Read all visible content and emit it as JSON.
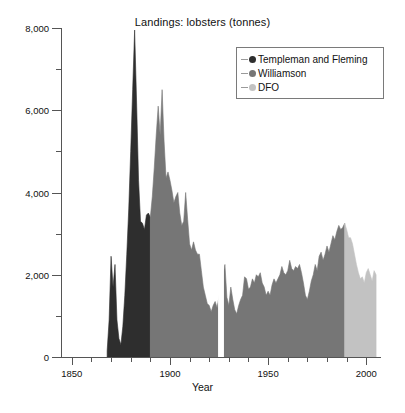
{
  "chart_data": {
    "type": "area",
    "title": "Landings: lobsters (tonnes)",
    "xlabel": "Year",
    "ylabel": "",
    "xlim": [
      1845,
      2007
    ],
    "ylim": [
      0,
      8000
    ],
    "grid": false,
    "legend_position": "top-right",
    "x_major_ticks": [
      1850,
      1900,
      1950,
      2000
    ],
    "x_major_tick_labels": [
      "1850",
      "1900",
      "1950",
      "2000"
    ],
    "x_minor_tick_step": 10,
    "y_major_ticks": [
      0,
      2000,
      4000,
      6000,
      8000
    ],
    "y_major_tick_labels": [
      "0",
      "2,000",
      "4,000",
      "6,000",
      "8,000"
    ],
    "y_minor_ticks": [
      1000,
      3000,
      5000,
      7000
    ],
    "series": [
      {
        "name": "Templeman and Fleming",
        "color": "#2e2e2e",
        "x": [
          1868,
          1869,
          1870,
          1871,
          1872,
          1873,
          1874,
          1875,
          1876,
          1877,
          1878,
          1879,
          1880,
          1881,
          1882,
          1883,
          1884,
          1885,
          1886,
          1887,
          1888,
          1889,
          1890
        ],
        "values": [
          150,
          900,
          2450,
          1700,
          2250,
          900,
          450,
          300,
          750,
          1500,
          2500,
          3600,
          5000,
          6500,
          7950,
          6200,
          4300,
          3300,
          3250,
          3100,
          3450,
          3500,
          3400
        ]
      },
      {
        "name": "Williamson",
        "color": "#767676",
        "x": [
          1890,
          1891,
          1892,
          1893,
          1894,
          1895,
          1896,
          1897,
          1898,
          1899,
          1900,
          1901,
          1902,
          1903,
          1904,
          1905,
          1906,
          1907,
          1908,
          1909,
          1910,
          1911,
          1912,
          1913,
          1914,
          1915,
          1916,
          1917,
          1918,
          1919,
          1920,
          1921,
          1922,
          1923,
          1924,
          1928,
          1929,
          1930,
          1931,
          1932,
          1933,
          1934,
          1935,
          1936,
          1937,
          1938,
          1939,
          1940,
          1941,
          1942,
          1943,
          1944,
          1945,
          1946,
          1947,
          1948,
          1949,
          1950,
          1951,
          1952,
          1953,
          1954,
          1955,
          1956,
          1957,
          1958,
          1959,
          1960,
          1961,
          1962,
          1963,
          1964,
          1965,
          1966,
          1967,
          1968,
          1969,
          1970,
          1971,
          1972,
          1973,
          1974,
          1975,
          1976,
          1977,
          1978,
          1979,
          1980,
          1981,
          1982,
          1983,
          1984,
          1985,
          1986,
          1987,
          1988,
          1989
        ],
        "values": [
          3400,
          3900,
          4600,
          5400,
          6100,
          5400,
          6500,
          5250,
          4350,
          4500,
          4300,
          4050,
          3750,
          3900,
          4000,
          3500,
          3200,
          3300,
          4000,
          3350,
          2750,
          2600,
          2800,
          2600,
          2500,
          2500,
          2100,
          1700,
          1500,
          1300,
          1250,
          1100,
          1250,
          1350,
          1200,
          2250,
          1450,
          1250,
          1700,
          1400,
          1150,
          1050,
          1250,
          1400,
          1500,
          1950,
          1900,
          1650,
          1700,
          1900,
          1800,
          2000,
          1950,
          2050,
          1800,
          1700,
          1500,
          1600,
          1500,
          1750,
          1900,
          1800,
          1900,
          2000,
          2200,
          2050,
          2000,
          2100,
          2350,
          2150,
          2100,
          2200,
          2150,
          2250,
          2050,
          1800,
          1500,
          1400,
          1600,
          1850,
          2000,
          2250,
          2100,
          2450,
          2550,
          2350,
          2500,
          2700,
          2550,
          2750,
          2950,
          2850,
          3050,
          3200,
          3100,
          3150,
          3250
        ]
      },
      {
        "name": "DFO",
        "color": "#c2c2c2",
        "x": [
          1989,
          1990,
          1991,
          1992,
          1993,
          1994,
          1995,
          1996,
          1997,
          1998,
          1999,
          2000,
          2001,
          2002,
          2003,
          2004,
          2005
        ],
        "values": [
          3250,
          3100,
          2900,
          2900,
          2750,
          2500,
          2250,
          2050,
          1900,
          1950,
          1800,
          2050,
          2150,
          2000,
          1850,
          2100,
          2000
        ]
      }
    ],
    "gap_years": [
      1925,
      1926,
      1927
    ]
  },
  "legend": {
    "items": [
      {
        "label": "Templeman and Fleming",
        "color": "#2e2e2e",
        "marker": "circle-marker"
      },
      {
        "label": "Williamson",
        "color": "#767676",
        "marker": "circle-marker"
      },
      {
        "label": "DFO",
        "color": "#c2c2c2",
        "marker": "circle-marker"
      }
    ]
  }
}
